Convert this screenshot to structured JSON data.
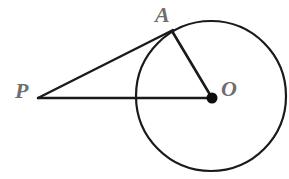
{
  "figure": {
    "type": "geometry-diagram",
    "background_color": "#ffffff",
    "stroke_color": "#1a1a1a",
    "label_color": "#6e6e6e",
    "canvas": {
      "width": 289,
      "height": 179
    },
    "circle": {
      "name": "circle-O",
      "center_x": 211,
      "center_y": 96,
      "radius": 75,
      "stroke_width": 2.2,
      "fill": "none"
    },
    "points": [
      {
        "id": "P",
        "label": "P",
        "x": 38,
        "y": 98,
        "marker": "none",
        "label_x": 15,
        "label_y": 80
      },
      {
        "id": "A",
        "label": "A",
        "x": 172,
        "y": 31,
        "marker": "none",
        "label_x": 155,
        "label_y": 4
      },
      {
        "id": "O",
        "label": "O",
        "x": 212,
        "y": 98,
        "marker": "filled-dot",
        "marker_radius": 5.5,
        "label_x": 221,
        "label_y": 78
      }
    ],
    "segments": [
      {
        "id": "PA",
        "from": "P",
        "to": "A",
        "x1": 38,
        "y1": 98,
        "x2": 173,
        "y2": 30,
        "stroke_width": 2.4,
        "role": "tangent"
      },
      {
        "id": "AO",
        "from": "A",
        "to": "O",
        "x1": 172,
        "y1": 31,
        "x2": 212,
        "y2": 98,
        "stroke_width": 2.6,
        "role": "radius"
      },
      {
        "id": "PO",
        "from": "P",
        "to": "O",
        "x1": 38,
        "y1": 98,
        "x2": 212,
        "y2": 98,
        "stroke_width": 2.4,
        "role": "secant"
      }
    ]
  }
}
